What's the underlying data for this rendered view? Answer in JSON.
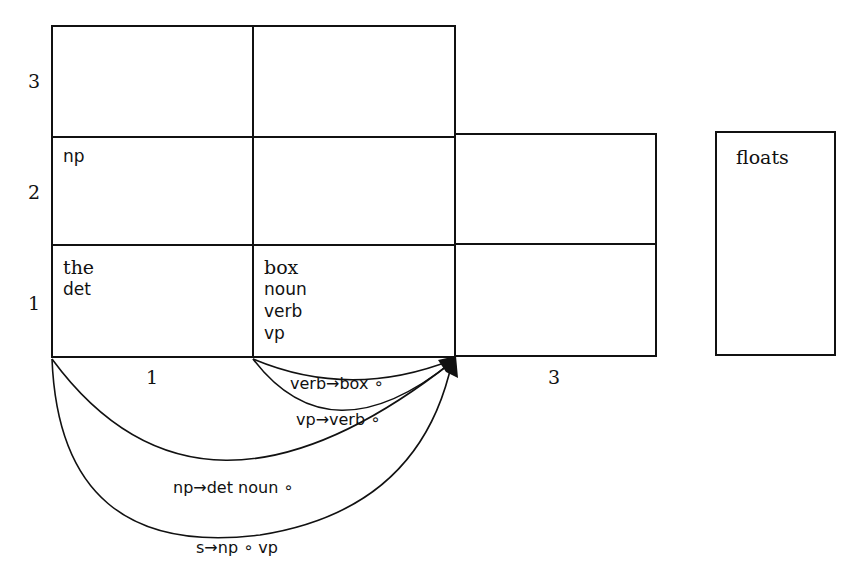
{
  "diagram": {
    "type": "chart-parse-table",
    "row_labels": [
      "3",
      "2",
      "1"
    ],
    "column_labels": [
      "1",
      "3"
    ],
    "cells": {
      "r2c1": [
        "np"
      ],
      "r1c1": {
        "word": "the",
        "categories": [
          "det"
        ]
      },
      "r1c2": {
        "word": "box",
        "categories": [
          "noun",
          "verb",
          "vp"
        ]
      }
    },
    "side_box": {
      "label": "floats"
    },
    "edges": [
      {
        "label": "verb→box ∘"
      },
      {
        "label": "vp→verb ∘"
      },
      {
        "label": "np→det noun ∘"
      },
      {
        "label": "s→np ∘ vp"
      }
    ],
    "colors": {
      "line": "#111111",
      "background": "#ffffff"
    }
  }
}
